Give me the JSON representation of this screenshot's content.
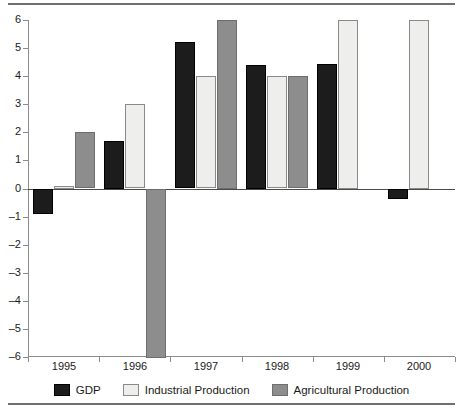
{
  "chart_data": {
    "type": "bar",
    "title": "",
    "subtitle": "",
    "xlabel": "",
    "ylabel": "",
    "categories": [
      "1995",
      "1996",
      "1997",
      "1998",
      "1999",
      "2000"
    ],
    "ylim": [
      -6,
      6
    ],
    "yticks": [
      6,
      5,
      4,
      3,
      2,
      1,
      0,
      -1,
      -2,
      -3,
      -4,
      -5,
      -6
    ],
    "ytick_labels": [
      "6",
      "5",
      "4",
      "3",
      "2",
      "1",
      "0",
      "–1",
      "–2",
      "–3",
      "–4",
      "–5",
      "–6"
    ],
    "grid": false,
    "legend_position": "bottom",
    "series": [
      {
        "name": "GDP",
        "color": "#1c1c1c",
        "values": [
          -0.9,
          1.7,
          5.2,
          4.4,
          4.45,
          -0.35
        ]
      },
      {
        "name": "Industrial Production",
        "color": "#eeeeec",
        "values": [
          0.1,
          3.0,
          4.0,
          4.0,
          6.0,
          6.0
        ]
      },
      {
        "name": "Agricultural Production",
        "color": "#8d8d8d",
        "values": [
          2.0,
          -6.0,
          6.0,
          4.0,
          null,
          null
        ]
      }
    ]
  },
  "legend": {
    "items": [
      {
        "label": "GDP",
        "swatch": "gdp"
      },
      {
        "label": "Industrial Production",
        "swatch": "industrial"
      },
      {
        "label": "Agricultural Production",
        "swatch": "agricultural"
      }
    ]
  }
}
